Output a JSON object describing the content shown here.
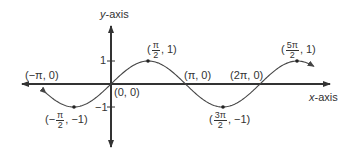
{
  "chart_data": {
    "type": "line",
    "title": "",
    "function": "y = sin(x)",
    "xlabel": "x-axis",
    "ylabel": "y-axis",
    "ylim": [
      -1,
      1
    ],
    "xlim": [
      -3.3,
      8.3
    ],
    "y_ticks": [
      "1",
      "-1"
    ],
    "grid": false,
    "legend": null,
    "series": [
      {
        "name": "sin(x)",
        "x": [
          -3.1416,
          -1.5708,
          0,
          1.5708,
          3.1416,
          4.7124,
          6.2832,
          7.854
        ],
        "values": [
          0,
          -1,
          0,
          1,
          0,
          -1,
          0,
          1
        ]
      }
    ],
    "annotations": [
      {
        "label": "(-π, 0)",
        "x": -3.1416,
        "y": 0
      },
      {
        "label": "(-π/2, -1)",
        "x": -1.5708,
        "y": -1
      },
      {
        "label": "(0, 0)",
        "x": 0,
        "y": 0
      },
      {
        "label": "(π/2, 1)",
        "x": 1.5708,
        "y": 1
      },
      {
        "label": "(π, 0)",
        "x": 3.1416,
        "y": 0
      },
      {
        "label": "(3π/2, -1)",
        "x": 4.7124,
        "y": -1
      },
      {
        "label": "(2π, 0)",
        "x": 6.2832,
        "y": 0
      },
      {
        "label": "(5π/2, 1)",
        "x": 7.854,
        "y": 1
      }
    ]
  },
  "labels": {
    "y_axis": {
      "var": "y",
      "rest": "-axis"
    },
    "x_axis": {
      "var": "x",
      "rest": "-axis"
    },
    "tick_pos": "1",
    "tick_neg": "−1",
    "neg_pi": "(−π, 0)",
    "origin": "(0, 0)",
    "pi": "(π, 0)",
    "two_pi": "(2π, 0)",
    "half_pi": {
      "open": "(",
      "num": "π",
      "den": "2",
      "close": ", 1)"
    },
    "neg_half_pi": {
      "open": "(−",
      "num": "π",
      "den": "2",
      "close": ", −1)"
    },
    "three_half_pi": {
      "open": "(",
      "num": "3π",
      "den": "2",
      "close": ", −1)"
    },
    "five_half_pi": {
      "open": "(",
      "num": "5π",
      "den": "2",
      "close": ", 1)"
    }
  },
  "colors": {
    "axis": "#333333",
    "curve": "#444444",
    "text": "#333333"
  }
}
